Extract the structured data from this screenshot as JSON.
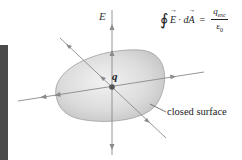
{
  "diagram": {
    "title_formula": {
      "integral_symbol": "∮",
      "lhs_vector_1": "E",
      "dot": "·",
      "lhs_d": "d",
      "lhs_vector_2": "A",
      "equals": "=",
      "numerator": "q",
      "numerator_sub": "enc",
      "denominator": "ε",
      "denominator_sub": "0"
    },
    "labels": {
      "field": "E",
      "charge": "q",
      "surface": "closed surface"
    },
    "colors": {
      "surface_fill_light": "#ebebeb",
      "surface_fill_dark": "#c4c4c4",
      "surface_stroke": "#9a9a9a",
      "field_line": "#8a8a8a",
      "charge": "#555555",
      "side_bar": "#4a4a4a"
    }
  }
}
